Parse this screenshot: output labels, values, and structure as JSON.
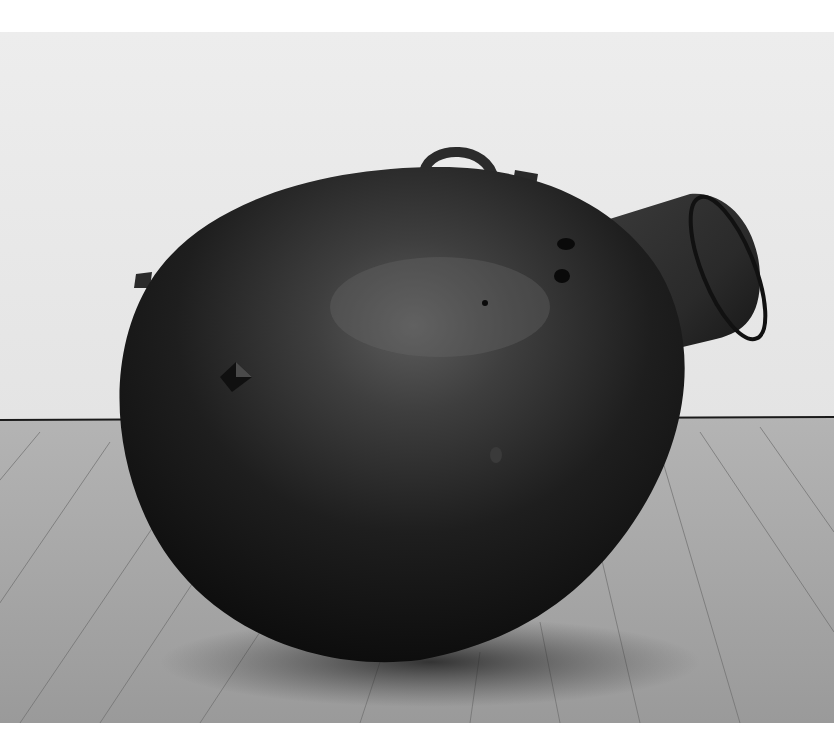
{
  "image": {
    "subject": "dark bronze egg-shaped sculpture with cylindrical spout, ring handle and small protrusions, resting on a wooden gallery floor",
    "colors": {
      "page_background": "#ffffff",
      "wall": "#ebebeb",
      "floor": "#a6a6a6",
      "sculpture_body": "#262626",
      "sculpture_highlight": "#5a5a5a",
      "baseboard_line": "#1a1a1a"
    }
  }
}
